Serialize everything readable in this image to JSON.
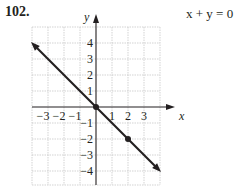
{
  "problem": {
    "number": "102.",
    "equation": "x + y = 0"
  },
  "chart_data": {
    "type": "line",
    "title": "x + y = 0",
    "xlabel": "x",
    "ylabel": "y",
    "xlim": [
      -4,
      4
    ],
    "ylim": [
      -4.7,
      4.7
    ],
    "grid": true,
    "x_ticks": [
      "-3",
      "-2",
      "-1",
      "1",
      "2",
      "3"
    ],
    "y_ticks": [
      "4",
      "3",
      "2",
      "1",
      "-1",
      "-2",
      "-3",
      "-4"
    ],
    "series": [
      {
        "name": "y = -x",
        "x": [
          -4,
          4
        ],
        "y": [
          4,
          -4
        ],
        "arrows_both_ends": true
      }
    ],
    "points": [
      {
        "x": 0,
        "y": 0
      },
      {
        "x": 2,
        "y": -2
      }
    ],
    "colors": {
      "line": "#231f20",
      "grid": "#c8c8c8",
      "axis": "#231f20"
    }
  }
}
